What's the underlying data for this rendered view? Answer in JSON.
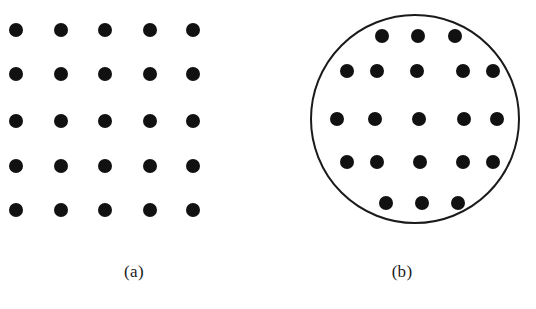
{
  "figure": {
    "background_color": "#ffffff",
    "dot_color": "#111111",
    "outline_color": "#1a1a1a",
    "dot_diameter": 14,
    "panels": [
      {
        "id": "a",
        "caption": "(a)",
        "shape": "square-grid",
        "has_boundary_outline": false,
        "dot_count": 25,
        "rows": 5,
        "columns": 5,
        "dots": [
          {
            "cx": 16,
            "cy": 30
          },
          {
            "cx": 61,
            "cy": 30
          },
          {
            "cx": 105,
            "cy": 30
          },
          {
            "cx": 150,
            "cy": 30
          },
          {
            "cx": 193,
            "cy": 30
          },
          {
            "cx": 16,
            "cy": 74
          },
          {
            "cx": 61,
            "cy": 74
          },
          {
            "cx": 105,
            "cy": 74
          },
          {
            "cx": 150,
            "cy": 74
          },
          {
            "cx": 193,
            "cy": 74
          },
          {
            "cx": 16,
            "cy": 121
          },
          {
            "cx": 61,
            "cy": 121
          },
          {
            "cx": 105,
            "cy": 121
          },
          {
            "cx": 150,
            "cy": 121
          },
          {
            "cx": 193,
            "cy": 121
          },
          {
            "cx": 16,
            "cy": 166
          },
          {
            "cx": 61,
            "cy": 166
          },
          {
            "cx": 105,
            "cy": 166
          },
          {
            "cx": 150,
            "cy": 166
          },
          {
            "cx": 193,
            "cy": 166
          },
          {
            "cx": 16,
            "cy": 210
          },
          {
            "cx": 61,
            "cy": 210
          },
          {
            "cx": 105,
            "cy": 210
          },
          {
            "cx": 150,
            "cy": 210
          },
          {
            "cx": 193,
            "cy": 210
          }
        ]
      },
      {
        "id": "b",
        "caption": "(b)",
        "shape": "circle-packed-grid",
        "has_boundary_outline": true,
        "boundary": {
          "cx": 147,
          "cy": 119,
          "radius": 105,
          "stroke_width": 2.5
        },
        "dot_count": 21,
        "rows": 5,
        "row_counts": [
          3,
          5,
          5,
          5,
          3
        ],
        "dots": [
          {
            "cx": 114,
            "cy": 36
          },
          {
            "cx": 150,
            "cy": 36
          },
          {
            "cx": 187,
            "cy": 36
          },
          {
            "cx": 79,
            "cy": 71
          },
          {
            "cx": 109,
            "cy": 71
          },
          {
            "cx": 149,
            "cy": 71
          },
          {
            "cx": 195,
            "cy": 71
          },
          {
            "cx": 225,
            "cy": 71
          },
          {
            "cx": 69,
            "cy": 119
          },
          {
            "cx": 107,
            "cy": 119
          },
          {
            "cx": 151,
            "cy": 119
          },
          {
            "cx": 196,
            "cy": 119
          },
          {
            "cx": 229,
            "cy": 119
          },
          {
            "cx": 79,
            "cy": 162
          },
          {
            "cx": 109,
            "cy": 162
          },
          {
            "cx": 152,
            "cy": 162
          },
          {
            "cx": 195,
            "cy": 162
          },
          {
            "cx": 225,
            "cy": 162
          },
          {
            "cx": 118,
            "cy": 203
          },
          {
            "cx": 154,
            "cy": 203
          },
          {
            "cx": 190,
            "cy": 203
          }
        ]
      }
    ]
  }
}
